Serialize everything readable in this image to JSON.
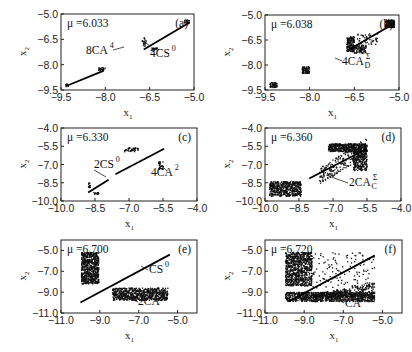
{
  "chart_data": [
    {
      "id": "a",
      "type": "scatter",
      "panel_label": "(a)",
      "mu_label": "μ =6.033",
      "xlabel": "x1",
      "ylabel": "x2",
      "xlim": [
        -9.5,
        -5.0
      ],
      "ylim": [
        -9.5,
        -5.0
      ],
      "xticks": [
        "-9.5",
        "-8.0",
        "-6.5",
        "-5.0"
      ],
      "xtick_values": [
        -9.5,
        -8.0,
        -6.5,
        -5.0
      ],
      "yticks": [
        "-5.0",
        "-6.5",
        "-8.0",
        "-9.5"
      ],
      "ytick_values": [
        -5.0,
        -6.5,
        -8.0,
        -9.5
      ],
      "frame": {
        "x": 61,
        "y": 14,
        "w": 133,
        "h": 76
      },
      "diagonal": [
        [
          -6.7,
          -7.1
        ],
        [
          -5.15,
          -5.5
        ]
      ],
      "diagonal_segments": [
        [
          [
            -9.3,
            -9.25
          ],
          [
            -8.05,
            -8.35
          ]
        ]
      ],
      "clusters": [
        {
          "x": [
            -5.35,
            -5.15
          ],
          "y": [
            -5.6,
            -5.35
          ],
          "n": 25
        },
        {
          "x": [
            -6.75,
            -6.6
          ],
          "y": [
            -6.9,
            -6.4
          ],
          "n": 20
        },
        {
          "x": [
            -6.45,
            -6.2
          ],
          "y": [
            -7.2,
            -7.0
          ],
          "n": 20
        },
        {
          "x": [
            -8.25,
            -8.0
          ],
          "y": [
            -8.35,
            -8.15
          ],
          "n": 20
        },
        {
          "x": [
            -9.35,
            -9.25
          ],
          "y": [
            -9.35,
            -9.15
          ],
          "n": 10
        }
      ],
      "annotations": [
        {
          "text": "8CA",
          "sup": "4",
          "sub": "",
          "x": 86,
          "y": 54,
          "line": [
            [
              113,
              50
            ],
            [
              124,
              47
            ]
          ]
        },
        {
          "text": "4CS",
          "sup": "0",
          "sub": "",
          "x": 150,
          "y": 57,
          "line": [
            [
              150,
              46
            ],
            [
              142,
              40
            ]
          ]
        }
      ]
    },
    {
      "id": "b",
      "type": "scatter",
      "panel_label": "(b)",
      "mu_label": "μ =6.038",
      "xlabel": "x1",
      "ylabel": "x2",
      "xlim": [
        -9.5,
        -5.0
      ],
      "ylim": [
        -9.5,
        -5.0
      ],
      "xticks": [
        "-9.5",
        "-8.0",
        "-6.5",
        "-5.0"
      ],
      "xtick_values": [
        -9.5,
        -8.0,
        -6.5,
        -5.0
      ],
      "yticks": [
        "-5.0",
        "-6.5",
        "-8.0",
        "-9.5"
      ],
      "ytick_values": [
        -5.0,
        -6.5,
        -8.0,
        -9.5
      ],
      "frame": {
        "x": 265,
        "y": 15,
        "w": 134,
        "h": 75
      },
      "diagonal": [
        [
          -6.7,
          -7.1
        ],
        [
          -5.15,
          -5.5
        ]
      ],
      "diagonal_segments": [],
      "clusters": [
        {
          "x": [
            -5.45,
            -5.15
          ],
          "y": [
            -5.75,
            -5.3
          ],
          "n": 160
        },
        {
          "x": [
            -6.75,
            -6.5
          ],
          "y": [
            -7.2,
            -6.3
          ],
          "n": 160
        },
        {
          "x": [
            -6.5,
            -6.1
          ],
          "y": [
            -7.3,
            -6.8
          ],
          "n": 90
        },
        {
          "x": [
            -6.4,
            -5.7
          ],
          "y": [
            -6.8,
            -6.1
          ],
          "n": 50
        },
        {
          "x": [
            -8.25,
            -8.0
          ],
          "y": [
            -8.5,
            -8.1
          ],
          "n": 90
        },
        {
          "x": [
            -9.35,
            -9.1
          ],
          "y": [
            -9.35,
            -9.05
          ],
          "n": 60
        }
      ],
      "annotations": [
        {
          "text": "4CA",
          "sup": "Σ",
          "sub": "D",
          "x": 342,
          "y": 65,
          "line": [
            [
              342,
              61
            ],
            [
              335,
              58
            ]
          ]
        }
      ]
    },
    {
      "id": "c",
      "type": "scatter",
      "panel_label": "(c)",
      "mu_label": "μ =6.330",
      "xlabel": "x1",
      "ylabel": "x2",
      "xlim": [
        -10.0,
        -4.0
      ],
      "ylim": [
        -10.0,
        -4.0
      ],
      "xticks": [
        "-10.0",
        "-8.5",
        "-7.0",
        "-5.5",
        "-4.0"
      ],
      "xtick_values": [
        -10.0,
        -8.5,
        -7.0,
        -5.5,
        -4.0
      ],
      "yticks": [
        "-4.0",
        "-5.5",
        "-7.0",
        "-8.5",
        "-10.0"
      ],
      "ytick_values": [
        -4.0,
        -5.5,
        -7.0,
        -8.5,
        -10.0
      ],
      "frame": {
        "x": 61,
        "y": 128,
        "w": 136,
        "h": 73
      },
      "diagonal": [
        [
          -7.6,
          -7.8
        ],
        [
          -5.45,
          -5.7
        ]
      ],
      "diagonal_segments": [
        [
          [
            -8.8,
            -9.3
          ],
          [
            -7.9,
            -8.25
          ]
        ]
      ],
      "clusters": [
        {
          "x": [
            -7.2,
            -6.6
          ],
          "y": [
            -5.95,
            -5.6
          ],
          "n": 40
        },
        {
          "x": [
            -5.7,
            -5.5
          ],
          "y": [
            -7.4,
            -6.7
          ],
          "n": 35
        },
        {
          "x": [
            -8.8,
            -8.7
          ],
          "y": [
            -8.9,
            -8.5
          ],
          "n": 12
        },
        {
          "x": [
            -8.6,
            -8.3
          ],
          "y": [
            -9.45,
            -9.3
          ],
          "n": 14
        }
      ],
      "annotations": [
        {
          "text": "2CS",
          "sup": "0",
          "sub": "",
          "x": 94,
          "y": 168,
          "line": [
            [
              94,
              170
            ],
            [
              106,
              177
            ]
          ]
        },
        {
          "text": "4CA",
          "sup": "2",
          "sub": "",
          "x": 151,
          "y": 176,
          "line": [
            [
              161,
              165
            ],
            [
              167,
              171
            ]
          ]
        }
      ]
    },
    {
      "id": "d",
      "type": "scatter",
      "panel_label": "(d)",
      "mu_label": "μ =6.360",
      "xlabel": "x1",
      "ylabel": "x2",
      "xlim": [
        -10.0,
        -4.0
      ],
      "ylim": [
        -10.0,
        -4.0
      ],
      "xticks": [
        "-10.0",
        "-8.5",
        "-7.0",
        "-5.5",
        "-4.0"
      ],
      "xtick_values": [
        -10.0,
        -8.5,
        -7.0,
        -5.5,
        -4.0
      ],
      "yticks": [
        "-4.0",
        "-5.5",
        "-7.0",
        "-8.5",
        "-10.0"
      ],
      "ytick_values": [
        -4.0,
        -5.5,
        -7.0,
        -8.5,
        -10.0
      ],
      "frame": {
        "x": 265,
        "y": 128,
        "w": 136,
        "h": 73
      },
      "diagonal": [
        [
          -8.05,
          -8.15
        ],
        [
          -5.5,
          -5.7
        ]
      ],
      "diagonal_segments": [],
      "clusters": [
        {
          "x": [
            -9.8,
            -8.4
          ],
          "y": [
            -9.6,
            -8.4
          ],
          "n": 500
        },
        {
          "x": [
            -7.2,
            -5.5
          ],
          "y": [
            -5.95,
            -5.3
          ],
          "n": 450
        },
        {
          "x": [
            -6.1,
            -5.5
          ],
          "y": [
            -7.5,
            -5.8
          ],
          "n": 250
        },
        {
          "x": [
            -7.6,
            -5.5
          ],
          "y": [
            -8.0,
            -5.5
          ],
          "n": 220,
          "band": true
        }
      ],
      "annotations": [
        {
          "text": "2CA",
          "sup": "Σ",
          "sub": "C",
          "x": 349,
          "y": 186,
          "line": [
            [
              348,
              183
            ],
            [
              326,
              175
            ]
          ]
        }
      ]
    },
    {
      "id": "e",
      "type": "scatter",
      "panel_label": "(e)",
      "mu_label": "μ =6.700",
      "xlabel": "x1",
      "ylabel": "x2",
      "xlim": [
        -11.0,
        -4.0
      ],
      "ylim": [
        -11.0,
        -4.0
      ],
      "xticks": [
        "-11.0",
        "-9.0",
        "-7.0",
        "-5.0"
      ],
      "xtick_values": [
        -11.0,
        -9.0,
        -7.0,
        -5.0
      ],
      "yticks": [
        "-5.0",
        "-7.0",
        "-9.0",
        "-11.0"
      ],
      "ytick_values": [
        -5.0,
        -7.0,
        -9.0,
        -11.0
      ],
      "frame": {
        "x": 61,
        "y": 240,
        "w": 136,
        "h": 73
      },
      "diagonal": [
        [
          -10.0,
          -10.0
        ],
        [
          -5.4,
          -5.4
        ]
      ],
      "diagonal_segments": [],
      "clusters": [
        {
          "x": [
            -9.95,
            -9.05
          ],
          "y": [
            -8.2,
            -5.2
          ],
          "n": 650
        },
        {
          "x": [
            -8.35,
            -5.5
          ],
          "y": [
            -9.8,
            -8.6
          ],
          "n": 700
        }
      ],
      "annotations": [
        {
          "text": "CS",
          "sup": "0",
          "sub": "",
          "x": 149,
          "y": 273,
          "line": [
            [
              148,
              270
            ],
            [
              141,
              266
            ]
          ]
        },
        {
          "text": "2CA",
          "sup": "1",
          "sub": "",
          "x": 138,
          "y": 305,
          "line": [
            [
              138,
              302
            ],
            [
              128,
              298
            ]
          ]
        }
      ]
    },
    {
      "id": "f",
      "type": "scatter",
      "panel_label": "(f)",
      "mu_label": "μ =6.720",
      "xlabel": "x1",
      "ylabel": "x2",
      "xlim": [
        -11.0,
        -4.0
      ],
      "ylim": [
        -11.0,
        -4.0
      ],
      "xticks": [
        "-11.0",
        "-9.0",
        "-7.0",
        "-5.0"
      ],
      "xtick_values": [
        -11.0,
        -9.0,
        -7.0,
        -5.0
      ],
      "yticks": [
        "-5.0",
        "-7.0",
        "-9.0",
        "-11.0"
      ],
      "ytick_values": [
        -5.0,
        -7.0,
        -9.0,
        -11.0
      ],
      "frame": {
        "x": 265,
        "y": 240,
        "w": 137,
        "h": 73
      },
      "diagonal": [
        [
          -9.8,
          -9.9
        ],
        [
          -5.4,
          -5.5
        ]
      ],
      "diagonal_segments": [],
      "clusters": [
        {
          "x": [
            -9.95,
            -8.6
          ],
          "y": [
            -8.4,
            -5.2
          ],
          "n": 800
        },
        {
          "x": [
            -9.95,
            -5.4
          ],
          "y": [
            -9.9,
            -9.0
          ],
          "n": 900
        },
        {
          "x": [
            -8.5,
            -5.4
          ],
          "y": [
            -9.5,
            -8.4
          ],
          "n": 350,
          "tri": true
        },
        {
          "x": [
            -8.6,
            -5.4
          ],
          "y": [
            -8.6,
            -5.2
          ],
          "n": 130
        }
      ],
      "annotations": [
        {
          "text": "CA",
          "sup": "Σ",
          "sub": "",
          "x": 345,
          "y": 307,
          "line": [
            [
              344,
              303
            ],
            [
              336,
              298
            ]
          ]
        }
      ]
    }
  ]
}
